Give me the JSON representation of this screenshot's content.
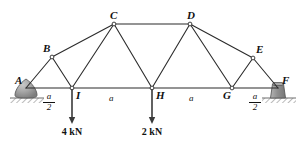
{
  "figure": {
    "type": "truss-free-body-diagram",
    "span_label": "A to F",
    "units": "kN"
  },
  "geometry": {
    "bottom_chord_y": 88,
    "nodes": [
      {
        "id": "A",
        "x": 26,
        "y": 88,
        "label": "A",
        "label_dx": -11,
        "label_dy": -13,
        "joint_circle": false
      },
      {
        "id": "I",
        "x": 72,
        "y": 88,
        "label": "I",
        "label_dx": 4,
        "label_dy": 2,
        "joint_circle": true
      },
      {
        "id": "H",
        "x": 152,
        "y": 88,
        "label": "H",
        "label_dx": 4,
        "label_dy": 2,
        "joint_circle": true
      },
      {
        "id": "G",
        "x": 232,
        "y": 88,
        "label": "G",
        "label_dx": -9,
        "label_dy": 2,
        "joint_circle": true
      },
      {
        "id": "F",
        "x": 278,
        "y": 88,
        "label": "F",
        "label_dx": 4,
        "label_dy": -13,
        "joint_circle": false
      },
      {
        "id": "B",
        "x": 52,
        "y": 57,
        "label": "B",
        "label_dx": -9,
        "label_dy": -14,
        "joint_circle": true
      },
      {
        "id": "C",
        "x": 114,
        "y": 24,
        "label": "C",
        "label_dx": -4,
        "label_dy": -14,
        "joint_circle": true
      },
      {
        "id": "D",
        "x": 190,
        "y": 24,
        "label": "D",
        "label_dx": -3,
        "label_dy": -14,
        "joint_circle": true
      },
      {
        "id": "E",
        "x": 253,
        "y": 58,
        "label": "E",
        "label_dx": 3,
        "label_dy": -14,
        "joint_circle": true
      }
    ],
    "members": [
      {
        "from": "A",
        "to": "I"
      },
      {
        "from": "I",
        "to": "H"
      },
      {
        "from": "H",
        "to": "G"
      },
      {
        "from": "G",
        "to": "F"
      },
      {
        "from": "A",
        "to": "B"
      },
      {
        "from": "B",
        "to": "C"
      },
      {
        "from": "C",
        "to": "D"
      },
      {
        "from": "D",
        "to": "E"
      },
      {
        "from": "E",
        "to": "F"
      },
      {
        "from": "B",
        "to": "I"
      },
      {
        "from": "C",
        "to": "I"
      },
      {
        "from": "C",
        "to": "H"
      },
      {
        "from": "D",
        "to": "H"
      },
      {
        "from": "D",
        "to": "G"
      },
      {
        "from": "E",
        "to": "G"
      }
    ]
  },
  "supports": [
    {
      "id": "support-A",
      "type": "pin-rocker",
      "x": 26,
      "y": 88,
      "ground_x": 10,
      "ground_w": 34
    },
    {
      "id": "support-F",
      "type": "roller-block",
      "x": 278,
      "y": 88,
      "ground_x": 262,
      "ground_w": 34
    }
  ],
  "loads": [
    {
      "id": "load-I",
      "at": "I",
      "x": 72,
      "magnitude": "4 kN",
      "direction": "down",
      "tip_y": 124,
      "label_y": 127
    },
    {
      "id": "load-H",
      "at": "H",
      "x": 152,
      "magnitude": "2 kN",
      "direction": "down",
      "tip_y": 124,
      "label_y": 127
    }
  ],
  "dimensions": [
    {
      "id": "dim-A-I",
      "kind": "fraction",
      "numerator": "a",
      "denominator": "2",
      "x": 49,
      "y": 92
    },
    {
      "id": "dim-I-H",
      "kind": "plain",
      "text": "a",
      "x": 112,
      "y": 93
    },
    {
      "id": "dim-H-G",
      "kind": "plain",
      "text": "a",
      "x": 192,
      "y": 93
    },
    {
      "id": "dim-G-F",
      "kind": "fraction",
      "numerator": "a",
      "denominator": "2",
      "x": 255,
      "y": 92
    }
  ],
  "style": {
    "member_color": "#2b2b2b",
    "member_width": 1.1,
    "node_fill": "#ffffff",
    "node_stroke": "#2b2b2b",
    "support_fill": "#9a9a9a",
    "support_stroke": "#4a4a4a",
    "ground_color": "#8c8c8c",
    "arrow_color": "#3a3a3a",
    "text_color": "#111111"
  }
}
